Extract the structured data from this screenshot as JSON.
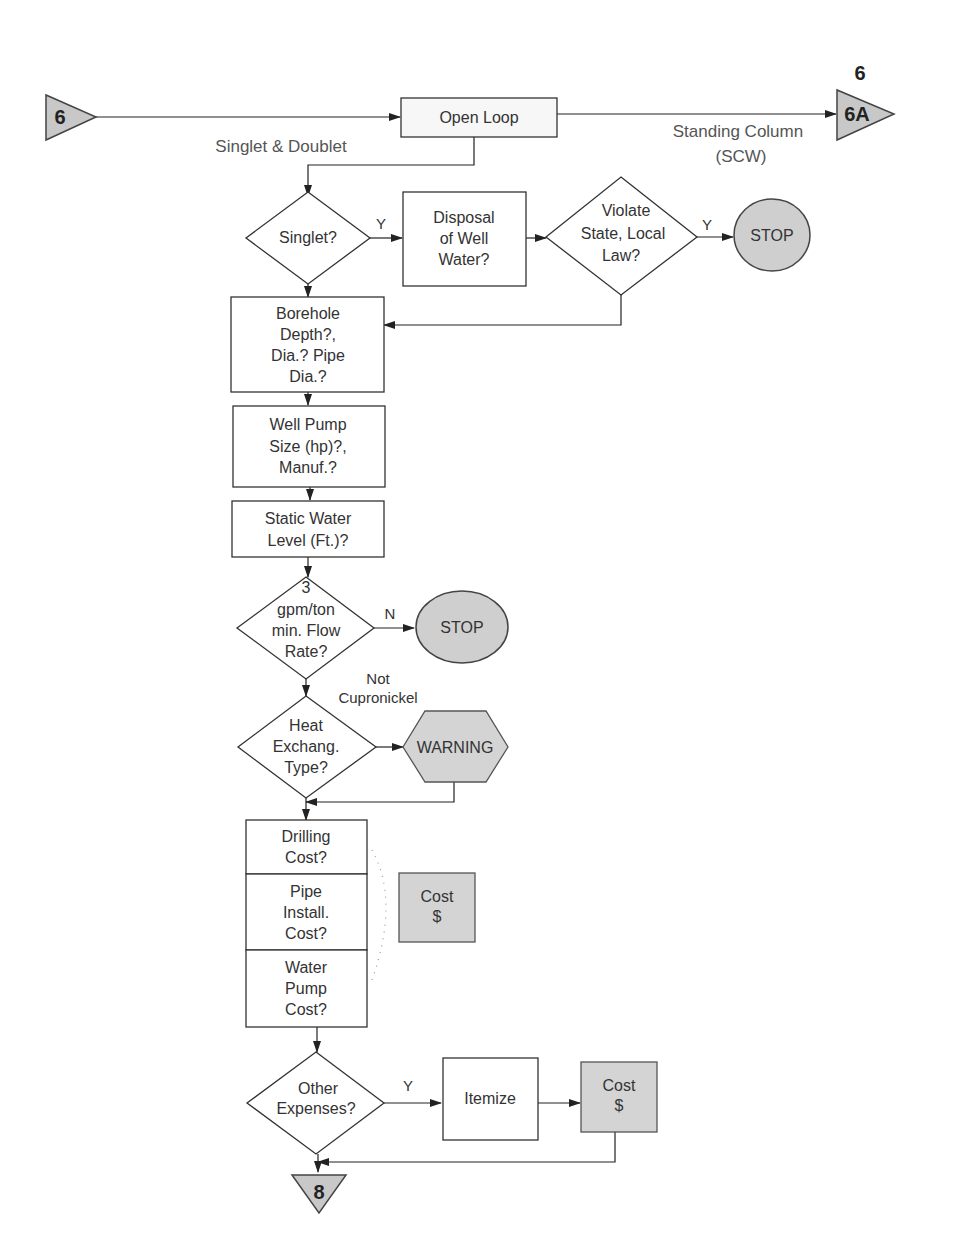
{
  "connectors": {
    "start": "6",
    "end_right": "6A",
    "end_right_label": "6",
    "end_bottom": "8"
  },
  "edge_labels": {
    "singlet_doublet": "Singlet & Doublet",
    "standing_column_1": "Standing Column",
    "standing_column_2": "(SCW)",
    "singlet_yes": "Y",
    "violate_yes": "Y",
    "flow_no": "N",
    "not_cupronickel_1": "Not",
    "not_cupronickel_2": "Cupronickel",
    "other_yes": "Y"
  },
  "nodes": {
    "open_loop": [
      "Open Loop"
    ],
    "singlet": [
      "Singlet?"
    ],
    "disposal": [
      "Disposal",
      "of Well",
      "Water?"
    ],
    "violate": [
      "Violate",
      "State, Local",
      "Law?"
    ],
    "stop1": [
      "STOP"
    ],
    "borehole": [
      "Borehole",
      "Depth?,",
      "Dia.? Pipe",
      "Dia.?"
    ],
    "well_pump": [
      "Well Pump",
      "Size (hp)?,",
      "Manuf.?"
    ],
    "static_water": [
      "Static Water",
      "Level (Ft.)?"
    ],
    "flow_rate": [
      "3",
      "gpm/ton",
      "min. Flow",
      "Rate?"
    ],
    "stop2": [
      "STOP"
    ],
    "heat_exchang": [
      "Heat",
      "Exchang.",
      "Type?"
    ],
    "warning": [
      "WARNING"
    ],
    "drilling_cost": [
      "Drilling",
      "Cost?"
    ],
    "pipe_install": [
      "Pipe",
      "Install.",
      "Cost?"
    ],
    "water_pump_cost": [
      "Water",
      "Pump",
      "Cost?"
    ],
    "cost1": [
      "Cost",
      "$"
    ],
    "other_expenses": [
      "Other",
      "Expenses?"
    ],
    "itemize": [
      "Itemize"
    ],
    "cost2": [
      "Cost",
      "$"
    ]
  }
}
